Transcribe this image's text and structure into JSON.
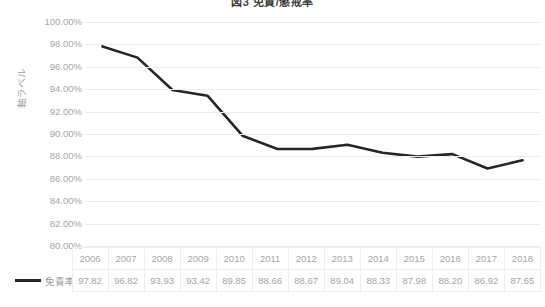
{
  "chart_data": {
    "type": "line",
    "title": "図3 免責/懲戒率",
    "xlabel": "",
    "ylabel": "軸ラベル",
    "ylim": [
      80,
      100
    ],
    "ytick_step": 2,
    "ytick_format": "percent",
    "grid": true,
    "legend_position": "table-row-header",
    "categories": [
      "2006",
      "2007",
      "2008",
      "2009",
      "2010",
      "2011",
      "2012",
      "2013",
      "2014",
      "2015",
      "2016",
      "2017",
      "2018"
    ],
    "ytick_labels": [
      "100.00%",
      "98.00%",
      "96.00%",
      "94.00%",
      "92.00%",
      "90.00%",
      "88.00%",
      "86.00%",
      "84.00%",
      "82.00%",
      "80.00%"
    ],
    "ytick_values": [
      100,
      98,
      96,
      94,
      92,
      90,
      88,
      86,
      84,
      82,
      80
    ],
    "series": [
      {
        "name": "免責率",
        "color": "#262626",
        "values": [
          97.82,
          96.82,
          93.93,
          93.42,
          89.85,
          88.66,
          88.67,
          89.04,
          88.33,
          87.98,
          88.2,
          86.92,
          87.65
        ],
        "value_labels": [
          "97.82",
          "96.82",
          "93.93",
          "93.42",
          "89.85",
          "88.66",
          "88.67",
          "89.04",
          "88.33",
          "87.98",
          "88.20",
          "86.92",
          "87.65"
        ]
      }
    ]
  },
  "table": {
    "corner_label": "",
    "row_header_label": "免責率"
  }
}
